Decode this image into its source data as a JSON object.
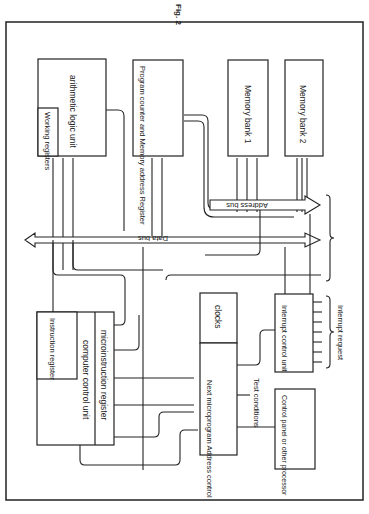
{
  "figure": {
    "caption": "Fig. 2",
    "orientation": "rotated 90° clockwise"
  },
  "blocks": {
    "alu": "arithmetic logic unit",
    "working_registers": "Working registers",
    "pc_mar": "Program counter and Memory address Register",
    "memory_bank_1": "Memory bank 1",
    "memory_bank_2": "Memory bank 2",
    "instruction_register": "Instruction register",
    "computer_control_unit": "computer control unit",
    "microinstruction_register": "microinstruction register",
    "clocks": "clocks",
    "next_microprogram": "Next microprogram Address control",
    "interrupt_control": "Interrupt control unit",
    "control_panel": "Control panel or other processor"
  },
  "labels": {
    "address_bus": "Address bus",
    "data_bus": "Data bus",
    "test_conditions": "Test conditions",
    "interrupt_request": "Interrupt request"
  }
}
